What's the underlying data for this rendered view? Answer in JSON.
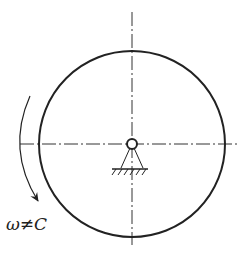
{
  "diagram": {
    "label": "ω≠C",
    "colors": {
      "stroke": "#222222",
      "background": "#ffffff"
    },
    "elements": {
      "disk": {
        "cx": 132,
        "cy": 144,
        "r": 93
      },
      "pivot": {
        "cx": 132,
        "cy": 144,
        "r": 5
      },
      "centerlines": [
        "horizontal",
        "vertical"
      ],
      "rotation_arrow": "clockwise"
    }
  }
}
